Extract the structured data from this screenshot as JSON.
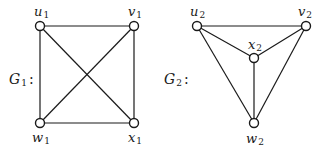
{
  "graphs": [
    {
      "id": "G1",
      "label": "G",
      "label_sub": "1",
      "label_suffix": ":",
      "vertices": [
        {
          "name": "u",
          "sub": "1",
          "x": 40,
          "y": 26
        },
        {
          "name": "v",
          "sub": "1",
          "x": 134,
          "y": 26
        },
        {
          "name": "w",
          "sub": "1",
          "x": 40,
          "y": 123
        },
        {
          "name": "x",
          "sub": "1",
          "x": 134,
          "y": 123
        }
      ],
      "edges": [
        [
          "u1",
          "v1"
        ],
        [
          "u1",
          "w1"
        ],
        [
          "u1",
          "x1"
        ],
        [
          "v1",
          "w1"
        ],
        [
          "v1",
          "x1"
        ],
        [
          "w1",
          "x1"
        ]
      ]
    },
    {
      "id": "G2",
      "label": "G",
      "label_sub": "2",
      "label_suffix": ":",
      "vertices": [
        {
          "name": "u",
          "sub": "2",
          "x": 197,
          "y": 26
        },
        {
          "name": "v",
          "sub": "2",
          "x": 306,
          "y": 26
        },
        {
          "name": "x",
          "sub": "2",
          "x": 254,
          "y": 58
        },
        {
          "name": "w",
          "sub": "2",
          "x": 254,
          "y": 123
        }
      ],
      "edges": [
        [
          "u2",
          "v2"
        ],
        [
          "u2",
          "x2"
        ],
        [
          "u2",
          "w2"
        ],
        [
          "v2",
          "x2"
        ],
        [
          "v2",
          "w2"
        ],
        [
          "x2",
          "w2"
        ]
      ]
    }
  ]
}
